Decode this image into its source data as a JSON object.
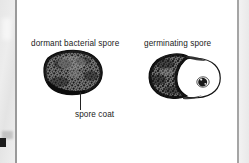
{
  "figure": {
    "type": "scanned-textbook-illustration",
    "background_color": "#ffffff",
    "ink_color": "#1a1a1a",
    "labels": {
      "dormant": "dormant bacterial spore",
      "germinating": "germinating spore",
      "spore_coat": "spore coat"
    },
    "panels": [
      {
        "name": "dormant-spore",
        "label": "dormant bacterial spore",
        "description": "rounded stippled dark spore body with thick spore coat",
        "callout": "spore coat"
      },
      {
        "name": "germinating-spore",
        "label": "germinating spore",
        "description": "crescent of ruptured dark spore coat with emerging pale vegetative cell containing a dark nucleoid",
        "callout": ""
      }
    ],
    "scan_artifacts": {
      "left_strip_color": "#e9e9e9",
      "rule_color": "#9a9a9a",
      "corner_mark_color": "#1b1b1b"
    }
  }
}
